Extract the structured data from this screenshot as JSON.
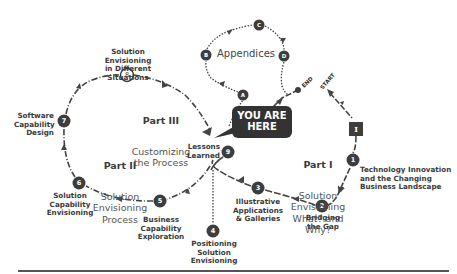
{
  "diagram": {
    "you_are_here": "YOU ARE\nHERE",
    "appendices_label": "Appendices",
    "start_label": "START",
    "end_label": "END",
    "parts": [
      {
        "id": "part1",
        "title": "Part I",
        "subtitle": "Solution\nEnvisioning\nWhat? and Why?"
      },
      {
        "id": "part2",
        "title": "Part II",
        "subtitle": "Solution\nEnvisioning\nProcess"
      },
      {
        "id": "part3",
        "title": "Part III",
        "subtitle": "Customizing\nthe Process"
      }
    ],
    "nodes": [
      {
        "id": "I",
        "shape": "square",
        "label": "I",
        "caption": ""
      },
      {
        "id": "1",
        "shape": "circle",
        "label": "1",
        "caption": "Technology Innovation\nand the Changing\nBusiness Landscape"
      },
      {
        "id": "2",
        "shape": "circle",
        "label": "2",
        "caption": "Bridging\nthe Gap"
      },
      {
        "id": "3",
        "shape": "circle",
        "label": "3",
        "caption": "Illustrative\nApplications\n& Galleries"
      },
      {
        "id": "4",
        "shape": "circle",
        "label": "4",
        "caption": "Positioning\nSolution Envisioning"
      },
      {
        "id": "5",
        "shape": "circle",
        "label": "5",
        "caption": "Business\nCapability\nExploration"
      },
      {
        "id": "6",
        "shape": "circle",
        "label": "6",
        "caption": "Solution\nCapability\nEnvisioning"
      },
      {
        "id": "7",
        "shape": "circle",
        "label": "7",
        "caption": "Software\nCapability\nDesign"
      },
      {
        "id": "8",
        "shape": "circle-outline",
        "label": "8",
        "caption": "Solution Envisioning\nin Different Situations"
      },
      {
        "id": "9",
        "shape": "circle",
        "label": "9",
        "caption": "Lessons\nLearned"
      },
      {
        "id": "A",
        "shape": "circle",
        "label": "A",
        "caption": ""
      },
      {
        "id": "B",
        "shape": "circle",
        "label": "B",
        "caption": ""
      },
      {
        "id": "C",
        "shape": "circle",
        "label": "C",
        "caption": ""
      },
      {
        "id": "D",
        "shape": "circle",
        "label": "D",
        "caption": ""
      }
    ],
    "colors": {
      "node_fill": "#3d3d3d",
      "line": "#444444",
      "bubble": "#333333",
      "text": "#333333"
    }
  }
}
